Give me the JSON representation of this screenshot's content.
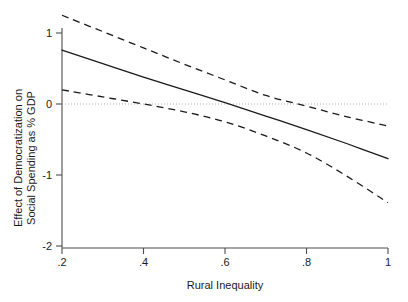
{
  "chart_data": {
    "type": "line",
    "title": "",
    "xlabel": "Rural Inequality",
    "ylabel": "Effect of Democratization on Social Spending as % GDP",
    "ylabel_line1": "Effect of Democratization on",
    "ylabel_line2": "Social Spending as % GDP",
    "xlim": [
      0.2,
      1.0
    ],
    "ylim": [
      -2,
      1.38
    ],
    "xticks": [
      0.2,
      0.4,
      0.6,
      0.8,
      1.0
    ],
    "xticklabels": [
      ".2",
      ".4",
      ".6",
      ".8",
      "1"
    ],
    "yticks": [
      1,
      0,
      -1,
      -2
    ],
    "yticklabels": [
      "1",
      "0",
      "-1",
      "-2"
    ],
    "grid": false,
    "legend": "none",
    "reference_line": {
      "name": "zero-reference-line",
      "y": 0,
      "style": "dotted",
      "color": "#b0b0b0"
    },
    "x": [
      0.2,
      0.3,
      0.4,
      0.5,
      0.6,
      0.7,
      0.8,
      0.9,
      1.0
    ],
    "series": [
      {
        "name": "Upper 95% CI",
        "style": "dashed",
        "color": "#1a1a1a",
        "values": [
          1.25,
          1.02,
          0.79,
          0.56,
          0.34,
          0.12,
          -0.03,
          -0.18,
          -0.31
        ]
      },
      {
        "name": "Marginal Effect",
        "style": "solid",
        "color": "#1a1a1a",
        "values": [
          0.76,
          0.57,
          0.38,
          0.2,
          0.02,
          -0.17,
          -0.36,
          -0.56,
          -0.77
        ]
      },
      {
        "name": "Lower 95% CI",
        "style": "dashed",
        "color": "#1a1a1a",
        "values": [
          0.2,
          0.1,
          0.0,
          -0.11,
          -0.25,
          -0.45,
          -0.69,
          -1.02,
          -1.39
        ]
      }
    ],
    "annotations": []
  }
}
